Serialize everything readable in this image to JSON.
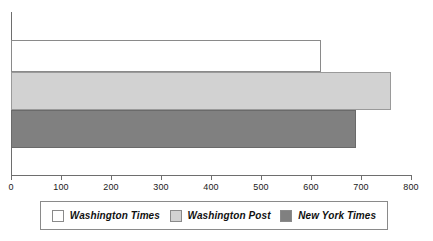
{
  "chart_data": {
    "type": "bar",
    "orientation": "horizontal",
    "title": "",
    "xlabel": "",
    "ylabel": "",
    "xlim": [
      0,
      800
    ],
    "grid": false,
    "legend_position": "bottom",
    "categories": [
      "Washington Times",
      "Washington Post",
      "New York Times"
    ],
    "values": [
      620,
      760,
      690
    ],
    "tick_labels": [
      "0",
      "100",
      "200",
      "300",
      "400",
      "500",
      "600",
      "700",
      "800"
    ],
    "tick_values": [
      0,
      100,
      200,
      300,
      400,
      500,
      600,
      700,
      800
    ],
    "series": [
      {
        "name": "Washington Times",
        "value": 620,
        "color": "#ffffff",
        "border_color": "#8a8a8a"
      },
      {
        "name": "Washington Post",
        "value": 760,
        "color": "#d2d2d2",
        "border_color": "#9a9a9a"
      },
      {
        "name": "New York Times",
        "value": 690,
        "color": "#808080",
        "border_color": "#6a6a6a"
      }
    ]
  },
  "legend": {
    "items": [
      {
        "label": "Washington Times",
        "color": "#ffffff"
      },
      {
        "label": "Washington Post",
        "color": "#d2d2d2"
      },
      {
        "label": "New York Times",
        "color": "#808080"
      }
    ]
  },
  "axis": {
    "line_color": "#6e6e6e"
  }
}
